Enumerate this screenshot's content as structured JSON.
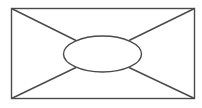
{
  "diagram": {
    "background": "#ffffff",
    "stroke_color": "#4a4a4a",
    "stroke_width": 1.4,
    "rectangle": {
      "x": 11.5,
      "y": 8.5,
      "width": 183,
      "height": 90
    },
    "ellipse": {
      "cx": 102.5,
      "cy": 54,
      "rx": 39,
      "ry": 18
    },
    "connectors": [
      {
        "name": "top-left",
        "x1": 11.5,
        "y1": 8.5,
        "x2": 76,
        "y2": 40.5
      },
      {
        "name": "top-right",
        "x1": 194.5,
        "y1": 8.5,
        "x2": 129,
        "y2": 40.5
      },
      {
        "name": "bottom-left",
        "x1": 11.5,
        "y1": 98.5,
        "x2": 76,
        "y2": 67.5
      },
      {
        "name": "bottom-right",
        "x1": 194.5,
        "y1": 98.5,
        "x2": 129,
        "y2": 67.5
      }
    ]
  }
}
